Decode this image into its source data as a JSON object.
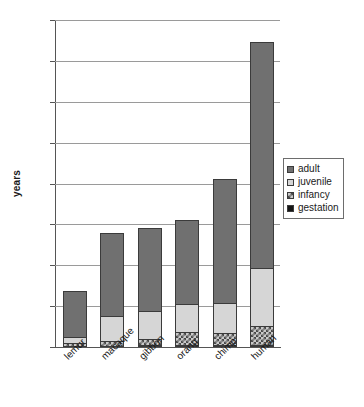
{
  "chart_data": {
    "type": "bar",
    "subtype": "stacked-bar",
    "title": "",
    "xlabel": "",
    "ylabel": "years",
    "ylim": [
      0,
      80
    ],
    "yticks": [
      0,
      10,
      20,
      30,
      40,
      50,
      60,
      70,
      80
    ],
    "ytick_labels": [
      "0",
      "10",
      "20",
      "30",
      "40",
      "50",
      "60",
      "70",
      "80"
    ],
    "grid": true,
    "legend_position": "right",
    "categories": [
      "lemur",
      "macaque",
      "gibbon",
      "orang",
      "chimp",
      "human"
    ],
    "series": [
      {
        "name": "gestation",
        "color": "#151515",
        "pattern": "solid-black",
        "values": [
          0.35,
          0.45,
          0.58,
          0.7,
          0.65,
          0.75
        ]
      },
      {
        "name": "infancy",
        "color": "#c9c9c9",
        "pattern": "hatched",
        "values": [
          0.75,
          1.25,
          1.6,
          3.2,
          3.0,
          4.6
        ]
      },
      {
        "name": "juvenile",
        "color": "#d6d6d6",
        "pattern": "light",
        "values": [
          1.6,
          6.1,
          6.7,
          6.9,
          7.15,
          14.2
        ]
      },
      {
        "name": "adult",
        "color": "#707070",
        "pattern": "dark-gray",
        "values": [
          11.0,
          20.0,
          20.1,
          20.2,
          30.2,
          55.0
        ]
      }
    ],
    "totals": [
      13.7,
      27.8,
      29.0,
      31.0,
      41.0,
      74.5
    ]
  },
  "legend": {
    "items": [
      {
        "label": "adult",
        "swatch": "dark-gray-swatch"
      },
      {
        "label": "juvenile",
        "swatch": "light-gray-swatch"
      },
      {
        "label": "infancy",
        "swatch": "hatched-swatch"
      },
      {
        "label": "gestation",
        "swatch": "black-swatch"
      }
    ]
  }
}
